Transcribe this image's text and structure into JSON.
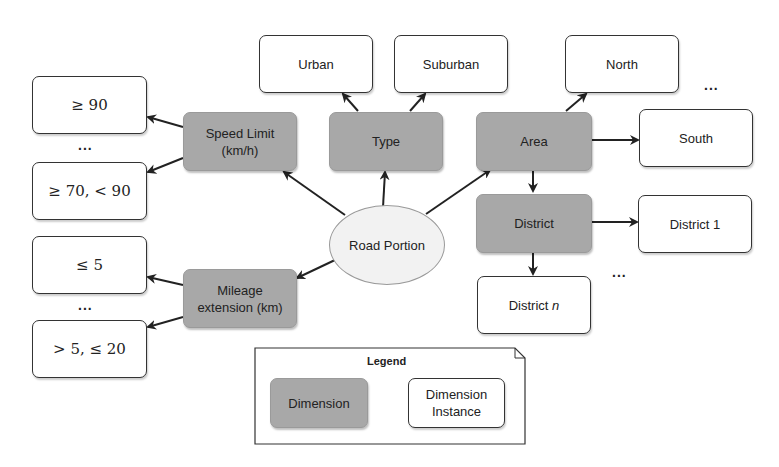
{
  "center": {
    "label": "Road Portion"
  },
  "dimensions": {
    "speed_limit": {
      "line1": "Speed Limit",
      "line2": "(km/h)"
    },
    "type": {
      "label": "Type"
    },
    "area": {
      "label": "Area"
    },
    "district": {
      "label": "District"
    },
    "mileage": {
      "line1": "Mileage",
      "line2": "extension (km)"
    }
  },
  "instances": {
    "speed_ge90": "≥ 90",
    "speed_70_90": "≥ 70, < 90",
    "urban": "Urban",
    "suburban": "Suburban",
    "north": "North",
    "south": "South",
    "district1": "District 1",
    "districtn_prefix": "District ",
    "districtn_var": "n",
    "mileage_le5": "≤ 5",
    "mileage_5_20": "> 5, ≤ 20"
  },
  "ellipsis": "...",
  "legend": {
    "title": "Legend",
    "dimension": "Dimension",
    "instance_line1": "Dimension",
    "instance_line2": "Instance"
  },
  "colors": {
    "dimension_fill": "#a8a8a8",
    "instance_fill": "#ffffff",
    "edge": "#222222"
  }
}
